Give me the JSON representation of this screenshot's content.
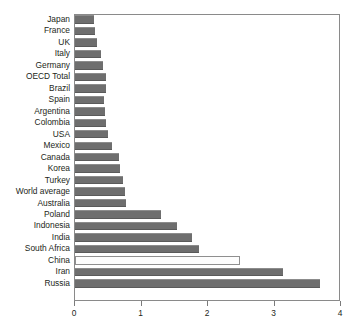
{
  "chart_data": {
    "type": "bar",
    "orientation": "horizontal",
    "title": "",
    "subtitle": "",
    "xlabel": "",
    "ylabel": "",
    "xlim": [
      0,
      4
    ],
    "ylim": null,
    "grid": false,
    "legend": null,
    "xticks": [
      "0",
      "1",
      "2",
      "3",
      "4"
    ],
    "xtick_values": [
      0,
      1,
      2,
      3,
      4
    ],
    "categories": [
      "Japan",
      "France",
      "UK",
      "Italy",
      "Germany",
      "OECD Total",
      "Brazil",
      "Spain",
      "Argentina",
      "Colombia",
      "USA",
      "Mexico",
      "Canada",
      "Korea",
      "Turkey",
      "World average",
      "Australia",
      "Poland",
      "Indonesia",
      "India",
      "South Africa",
      "China",
      "Iran",
      "Russia"
    ],
    "values": [
      0.28,
      0.3,
      0.33,
      0.39,
      0.42,
      0.46,
      0.47,
      0.44,
      0.45,
      0.47,
      0.49,
      0.55,
      0.66,
      0.68,
      0.72,
      0.75,
      0.77,
      1.3,
      1.54,
      1.76,
      1.86,
      2.48,
      3.13,
      3.69
    ],
    "highlighted_category": "China",
    "highlight_style": "unfilled-outline",
    "bar_color": "#6e6e6e",
    "highlight_color": "#fdfdfd",
    "axis_color": "#8a8a8a",
    "text_color": "#231f20"
  }
}
